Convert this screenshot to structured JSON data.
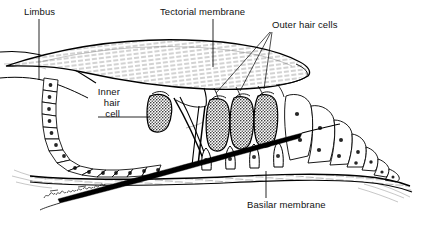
{
  "figure": {
    "background_color": "#ffffff",
    "ink_color": "#000000",
    "width": 422,
    "height": 228
  },
  "labels": {
    "limbus": "Limbus",
    "tectorial_membrane": "Tectorial membrane",
    "outer_hair_cells": "Outer hair cells",
    "inner_hair_cell": {
      "line1": "Inner",
      "line2": "hair",
      "line3": "cell"
    },
    "basilar_membrane": "Basilar membrane"
  },
  "signature": {
    "text": "Wethmanfeld",
    "style": "cursive-handwritten"
  },
  "structures": [
    {
      "name": "limbus",
      "description": "spiral limbus shelf at upper left"
    },
    {
      "name": "tectorial-membrane",
      "description": "large striated gelatinous flap overhanging the hair cells"
    },
    {
      "name": "inner-sulcus-cells",
      "description": "curved chain of cuboidal epithelial cells forming the inner spiral sulcus"
    },
    {
      "name": "inner-hair-cell",
      "description": "single dark stippled hair cell medial to the pillar cells"
    },
    {
      "name": "outer-hair-cells",
      "description": "three dark stippled hair cells in a row",
      "count": 3
    },
    {
      "name": "pillar-cells",
      "description": "tunnel of Corti formed by inner and outer pillar cells"
    },
    {
      "name": "supporting-cells",
      "description": "Deiters and Hensen cells lateral to the outer hair cells"
    },
    {
      "name": "basilar-membrane",
      "description": "fibrous membrane forming the floor of the organ of Corti"
    },
    {
      "name": "nerve-fiber-wedge",
      "description": "thick dark diagonal wedge crossing the lower field"
    }
  ],
  "leader_lines": {
    "limbus": "vertical line from label down to the limbus shelf",
    "tectorial_membrane": "vertical line from label down into the tectorial membrane",
    "outer_hair_cells": "three lines fanning down-left to each outer hair cell",
    "inner_hair_cell": "horizontal line from 'cell' right to the inner hair cell",
    "basilar_membrane": "vertical line from label up to the basilar membrane"
  }
}
